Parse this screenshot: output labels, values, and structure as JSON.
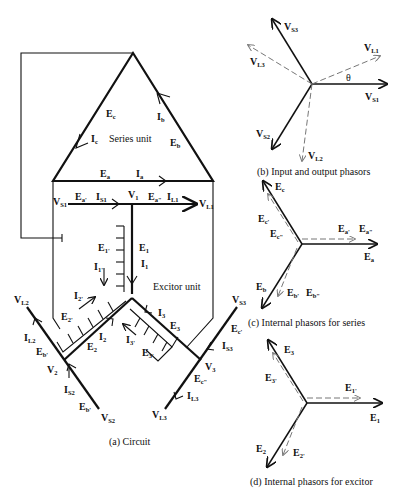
{
  "figure": {
    "circuit": {
      "caption": "(a)  Circuit",
      "unit_labels": {
        "series": "Series unit",
        "exciter": "Excitor unit"
      },
      "labels": {
        "Ec": [
          "E",
          "c"
        ],
        "Ic": [
          "I",
          "c"
        ],
        "Ib": [
          "I",
          "b"
        ],
        "Eb": [
          "E",
          "b"
        ],
        "Ea": [
          "E",
          "a"
        ],
        "Ia": [
          "I",
          "a"
        ],
        "VS1": [
          "V",
          "S1"
        ],
        "Ea1": [
          "E",
          "a'"
        ],
        "IS1": [
          "I",
          "S1"
        ],
        "V1": [
          "V",
          "1"
        ],
        "Ea2": [
          "E",
          "a\""
        ],
        "IL1": [
          "I",
          "L1"
        ],
        "VL1": [
          "V",
          "L1"
        ],
        "E1p": [
          "E",
          "1'"
        ],
        "E1": [
          "E",
          "1"
        ],
        "I1p": [
          "I",
          "1'"
        ],
        "I1": [
          "I",
          "1"
        ],
        "VL2": [
          "V",
          "L2"
        ],
        "IL2": [
          "I",
          "L2"
        ],
        "Eb1": [
          "E",
          "b'"
        ],
        "V2": [
          "V",
          "2"
        ],
        "IS2": [
          "I",
          "S2"
        ],
        "Eb2": [
          "E",
          "b'"
        ],
        "VS2": [
          "V",
          "S2"
        ],
        "I2p": [
          "I",
          "2'"
        ],
        "E2p": [
          "E",
          "2'"
        ],
        "I2": [
          "I",
          "2"
        ],
        "E2": [
          "E",
          "2"
        ],
        "I3": [
          "I",
          "3"
        ],
        "E3": [
          "E",
          "3"
        ],
        "I3p": [
          "I",
          "3'"
        ],
        "E3p": [
          "E",
          "3'"
        ],
        "VS3": [
          "V",
          "S3"
        ],
        "Ec1": [
          "E",
          "c'"
        ],
        "IS3": [
          "I",
          "S3"
        ],
        "V3": [
          "V",
          "3"
        ],
        "Ec2": [
          "E",
          "c\""
        ],
        "IL3": [
          "I",
          "L3"
        ],
        "VL3": [
          "V",
          "L3"
        ]
      }
    },
    "phasors_io": {
      "caption": "(b)  Input and output phasors",
      "labels": {
        "VS3": [
          "V",
          "S3"
        ],
        "VL1": [
          "V",
          "L1"
        ],
        "VL3": [
          "V",
          "L3"
        ],
        "theta": "θ",
        "VS1": [
          "V",
          "S1"
        ],
        "VS2": [
          "V",
          "S2"
        ],
        "VL2": [
          "V",
          "L2"
        ]
      }
    },
    "phasors_series": {
      "caption": "(c)  Internal phasors for series",
      "labels": {
        "Ec": [
          "E",
          "c"
        ],
        "Ec1": [
          "E",
          "c'"
        ],
        "Ec2": [
          "E",
          "c\""
        ],
        "Ea1": [
          "E",
          "a'"
        ],
        "Ea2": [
          "E",
          "a\""
        ],
        "Ea": [
          "E",
          "a"
        ],
        "Eb": [
          "E",
          "b"
        ],
        "Eb1": [
          "E",
          "b'"
        ],
        "Eb2": [
          "E",
          "b\""
        ]
      }
    },
    "phasors_exciter": {
      "caption": "(d)  Internal phasors for excitor",
      "labels": {
        "E3": [
          "E",
          "3"
        ],
        "E3p": [
          "E",
          "3'"
        ],
        "E1p": [
          "E",
          "1'"
        ],
        "E1": [
          "E",
          "1"
        ],
        "E2": [
          "E",
          "2"
        ],
        "E2p": [
          "E",
          "2'"
        ]
      }
    }
  }
}
